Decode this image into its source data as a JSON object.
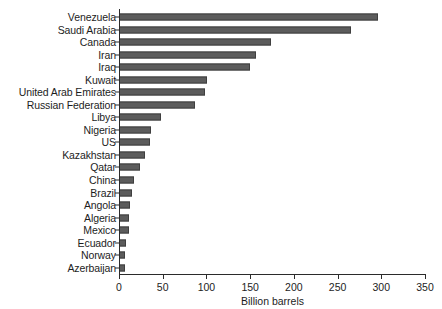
{
  "chart_data": {
    "type": "bar",
    "orientation": "horizontal",
    "title": "",
    "subtitle": "",
    "xlabel": "Billion barrels",
    "ylabel": "",
    "xlim": [
      0,
      350
    ],
    "xticks": [
      0,
      50,
      100,
      150,
      200,
      250,
      300,
      350
    ],
    "xtick_labels": [
      "0",
      "50",
      "100",
      "150",
      "200",
      "250",
      "300",
      "350"
    ],
    "grid": false,
    "legend": null,
    "bar_color": "#5c5c5c",
    "bar_edge_color": "#3f3f3f",
    "axis_color": "#2b2b2b",
    "background_color": "#ffffff",
    "categories": [
      "Venezuela",
      "Saudi Arabia",
      "Canada",
      "Iran",
      "Iraq",
      "Kuwait",
      "United Arab Emirates",
      "Russian Federation",
      "Libya",
      "Nigeria",
      "US",
      "Kazakhstan",
      "Qatar",
      "China",
      "Brazil",
      "Angola",
      "Algeria",
      "Mexico",
      "Ecuador",
      "Norway",
      "Azerbaijan"
    ],
    "values": [
      296,
      265,
      174,
      157,
      150,
      101,
      98,
      87,
      48,
      37,
      35,
      30,
      24,
      17,
      15,
      13,
      12,
      11,
      8,
      7,
      7
    ],
    "series": [
      {
        "name": "Proved oil reserves",
        "values": [
          296,
          265,
          174,
          157,
          150,
          101,
          98,
          87,
          48,
          37,
          35,
          30,
          24,
          17,
          15,
          13,
          12,
          11,
          8,
          7,
          7
        ]
      }
    ]
  }
}
